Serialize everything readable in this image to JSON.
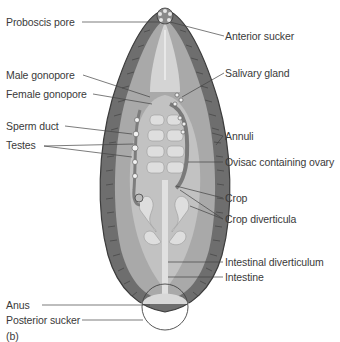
{
  "figure": {
    "panel_label": "(b)",
    "colors": {
      "body_wall": "#6e6e6e",
      "body_wall_outline": "#3c3c3c",
      "inner_body": "#a9a9a9",
      "gut_background": "#c8c8c8",
      "crop_diverticula": "#dcdcdc",
      "line": "#444444",
      "text": "#3a3a3a"
    }
  },
  "labels": {
    "left": [
      {
        "id": "proboscis-pore",
        "text": "Proboscis pore"
      },
      {
        "id": "male-gonopore",
        "text": "Male gonopore"
      },
      {
        "id": "female-gonopore",
        "text": "Female gonopore"
      },
      {
        "id": "sperm-duct",
        "text": "Sperm duct"
      },
      {
        "id": "testes",
        "text": "Testes"
      },
      {
        "id": "anus",
        "text": "Anus"
      },
      {
        "id": "posterior-sucker",
        "text": "Posterior sucker"
      }
    ],
    "right": [
      {
        "id": "anterior-sucker",
        "text": "Anterior sucker"
      },
      {
        "id": "salivary-gland",
        "text": "Salivary gland"
      },
      {
        "id": "annuli",
        "text": "Annuli"
      },
      {
        "id": "ovisac",
        "text": "Ovisac containing ovary"
      },
      {
        "id": "crop",
        "text": "Crop"
      },
      {
        "id": "crop-diverticula",
        "text": "Crop diverticula"
      },
      {
        "id": "intestinal-diverticulum",
        "text": "Intestinal diverticulum"
      },
      {
        "id": "intestine",
        "text": "Intestine"
      }
    ]
  }
}
